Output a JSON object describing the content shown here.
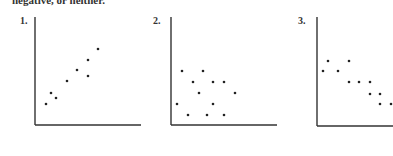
{
  "header": {
    "text": "negative, or neither."
  },
  "chart_data": [
    {
      "type": "scatter",
      "label": "1.",
      "title": "",
      "xlabel": "",
      "ylabel": "",
      "grid": false,
      "trend": "positive",
      "axis": {
        "x0": 35,
        "y0": 125,
        "xEnd": 141,
        "yTop": 17
      },
      "points": [
        [
          46,
          104
        ],
        [
          51,
          93
        ],
        [
          56,
          98
        ],
        [
          67,
          81
        ],
        [
          77,
          70
        ],
        [
          88,
          60
        ],
        [
          88,
          76
        ],
        [
          98,
          49
        ]
      ]
    },
    {
      "type": "scatter",
      "label": "2.",
      "title": "",
      "xlabel": "",
      "ylabel": "",
      "grid": false,
      "trend": "neither",
      "axis": {
        "x0": 171,
        "y0": 125,
        "xEnd": 277,
        "yTop": 17
      },
      "points": [
        [
          182,
          71
        ],
        [
          203,
          71
        ],
        [
          193,
          82
        ],
        [
          213,
          82
        ],
        [
          224,
          82
        ],
        [
          199,
          93
        ],
        [
          235,
          93
        ],
        [
          177,
          104
        ],
        [
          213,
          104
        ],
        [
          188,
          115
        ],
        [
          207,
          115
        ],
        [
          224,
          115
        ]
      ]
    },
    {
      "type": "scatter",
      "label": "3.",
      "title": "",
      "xlabel": "",
      "ylabel": "",
      "grid": false,
      "trend": "negative",
      "axis": {
        "x0": 317,
        "y0": 126,
        "xEnd": 393,
        "yTop": 17
      },
      "points": [
        [
          323,
          71
        ],
        [
          328,
          61
        ],
        [
          338,
          71
        ],
        [
          349,
          61
        ],
        [
          349,
          82
        ],
        [
          359,
          82
        ],
        [
          370,
          82
        ],
        [
          370,
          94
        ],
        [
          380,
          94
        ],
        [
          380,
          104
        ],
        [
          391,
          104
        ]
      ]
    }
  ],
  "colors": {
    "axis": "#333333",
    "point": "#222222"
  }
}
